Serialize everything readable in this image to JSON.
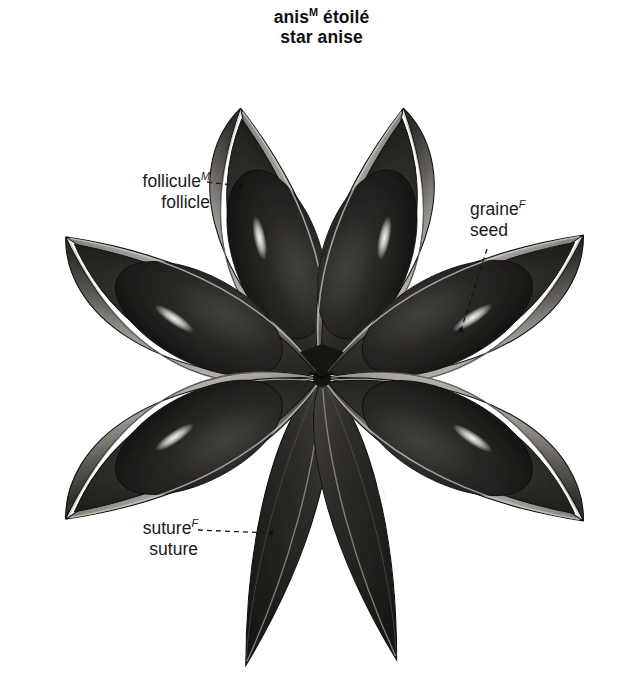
{
  "title": {
    "french": "anis",
    "french_sup": "M",
    "french_rest": " étoilé",
    "english": "star anise"
  },
  "callouts": [
    {
      "id": "follicule",
      "french": "follicule",
      "french_sup": "M",
      "english": "follicle",
      "leader": {
        "x1": 207,
        "y1": 182,
        "x2": 241,
        "y2": 186,
        "dot_x": 241,
        "dot_y": 186
      }
    },
    {
      "id": "graine",
      "french": "graine",
      "french_sup": "F",
      "english": "seed",
      "leader": {
        "x1": 487,
        "y1": 249,
        "x2": 461,
        "y2": 330,
        "dot_x": 461,
        "dot_y": 330
      }
    },
    {
      "id": "suture",
      "french": "suture",
      "french_sup": "F",
      "english": "suture",
      "leader": {
        "x1": 198,
        "y1": 530,
        "x2": 271,
        "y2": 533,
        "dot_x": 271,
        "dot_y": 533
      }
    }
  ],
  "illustration": {
    "subject": "star-anise-fruit",
    "center": {
      "x": 322,
      "y": 378
    },
    "follicle_count": 8,
    "open_follicle_count": 6,
    "closed_follicle_count": 2,
    "palette": {
      "background": "#ffffff",
      "shell_light": "#b9b6b2",
      "shell_mid": "#7c7974",
      "shell_dark": "#3a3834",
      "interior_dark": "#2a2825",
      "seed_dark": "#272523",
      "seed_core": "#1b1a18",
      "highlight": "#f2f0ec",
      "outline": "#14130f",
      "label_text": "#1a1a1a"
    },
    "follicles": [
      {
        "name": "upper-left",
        "angle_deg": 117,
        "state": "open",
        "tip": {
          "x": 215,
          "y": 103
        },
        "has_seed": true,
        "has_highlight": true
      },
      {
        "name": "upper-right",
        "angle_deg": 63,
        "state": "open",
        "tip": {
          "x": 455,
          "y": 100
        },
        "has_seed": true,
        "has_highlight": true
      },
      {
        "name": "left-upper",
        "angle_deg": 162,
        "state": "open",
        "tip": {
          "x": 48,
          "y": 296
        },
        "has_seed": true,
        "has_highlight": true
      },
      {
        "name": "left-lower",
        "angle_deg": 198,
        "state": "open",
        "tip": {
          "x": 48,
          "y": 481
        },
        "has_seed": true,
        "has_highlight": true
      },
      {
        "name": "right-upper",
        "angle_deg": 18,
        "state": "open",
        "tip": {
          "x": 616,
          "y": 278
        },
        "has_seed": true,
        "has_highlight": true
      },
      {
        "name": "right-lower",
        "angle_deg": 342,
        "state": "open",
        "tip": {
          "x": 616,
          "y": 490
        },
        "has_seed": true,
        "has_highlight": true
      },
      {
        "name": "bottom-left",
        "angle_deg": 254,
        "state": "closed",
        "tip": {
          "x": 240,
          "y": 672
        },
        "has_seed": false,
        "has_highlight": false
      },
      {
        "name": "bottom-right",
        "angle_deg": 286,
        "state": "closed",
        "tip": {
          "x": 430,
          "y": 670
        },
        "has_seed": false,
        "has_highlight": true
      }
    ]
  }
}
